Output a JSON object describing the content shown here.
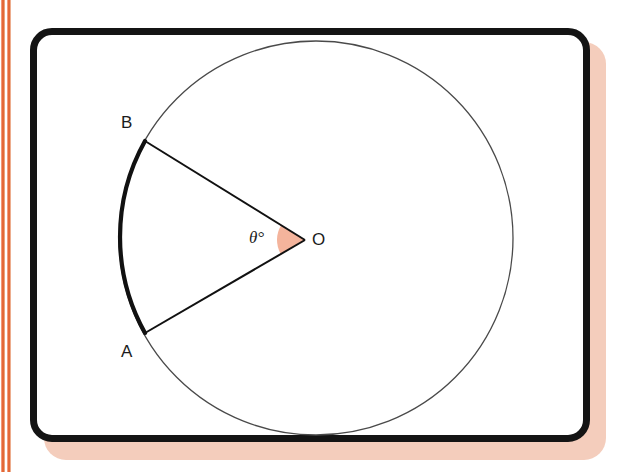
{
  "page": {
    "background_color": "#ffffff",
    "width": 634,
    "height": 472
  },
  "decor": {
    "stripes": [
      {
        "name": "outer-orange-stripe",
        "color": "#e8663a",
        "x": 1,
        "width": 4
      },
      {
        "name": "inner-orange-stripe",
        "color": "#e8673b",
        "x": 7,
        "width": 4
      }
    ],
    "card_shadow_color": "#f4cdbc"
  },
  "card": {
    "border_color": "#141414",
    "fill_color": "#ffffff",
    "border_radius": 22,
    "border_width": 7
  },
  "diagram": {
    "type": "circle-sector",
    "circle": {
      "center": {
        "x": 316,
        "y": 238
      },
      "radius": 197,
      "stroke_color": "#4a4a4a",
      "stroke_width": 1.3
    },
    "arc": {
      "name": "major-arc-AB",
      "from_point": "A",
      "to_point": "B",
      "stroke_color": "#111111",
      "stroke_width": 4.2,
      "start_angle_deg": 151,
      "end_angle_deg": 209
    },
    "radii": [
      {
        "name": "radius-OA",
        "from": "O",
        "to": "A"
      },
      {
        "name": "radius-OB",
        "from": "O",
        "to": "B"
      }
    ],
    "angle_wedge": {
      "name": "theta-angle-wedge",
      "fill_color": "#f4b49c",
      "radius": 28,
      "vertex": "O"
    },
    "points": [
      {
        "id": "A",
        "label": "A",
        "x": 145,
        "y": 333,
        "label_x": 121,
        "label_y": 343
      },
      {
        "id": "B",
        "label": "B",
        "x": 145,
        "y": 141,
        "label_x": 121,
        "label_y": 114
      },
      {
        "id": "O",
        "label": "O",
        "x": 305,
        "y": 240,
        "label_x": 312,
        "label_y": 231
      }
    ],
    "angle_label": {
      "text": "θ°",
      "x": 249,
      "y": 229
    }
  }
}
